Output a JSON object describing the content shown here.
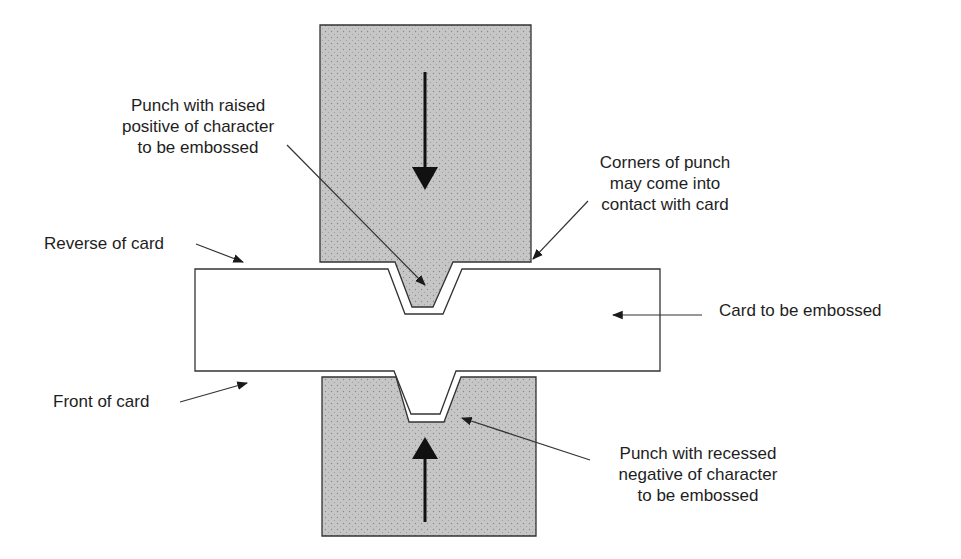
{
  "diagram": {
    "colors": {
      "punch_fill": "#c4c4c4",
      "outline": "#333333",
      "card_fill": "#ffffff",
      "text": "#1e1e1e"
    },
    "labels": {
      "top_punch": {
        "lines": [
          "Punch with raised",
          "positive of character",
          "to be embossed"
        ]
      },
      "corners": {
        "lines": [
          "Corners of punch",
          "may come into",
          "contact with card"
        ]
      },
      "reverse": "Reverse of card",
      "card": "Card to be embossed",
      "front": "Front of card",
      "bottom_punch": {
        "lines": [
          "Punch with recessed",
          "negative of character",
          "to be embossed"
        ]
      }
    },
    "motion_arrows": {
      "top_punch": "down",
      "bottom_punch": "up"
    }
  }
}
